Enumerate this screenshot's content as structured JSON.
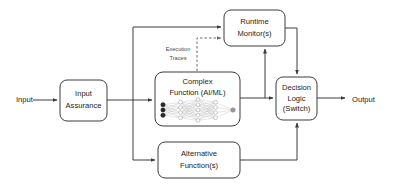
{
  "diagram": {
    "colors": {
      "stroke": "#3c3c3c",
      "dashed_stroke": "#6b6b6b",
      "text": "#1c1c1c",
      "trace_text": "#4a4a4a",
      "box_fill": "#ffffff",
      "background": "#ffffff",
      "nn_input_node": "#2a2a2a",
      "nn_hidden_node": "#ffffff",
      "nn_output_node": "#9a9a9a",
      "nn_edge": "#b8b8b8"
    },
    "io": {
      "input_label": "Input",
      "output_label": "Output"
    },
    "nodes": [
      {
        "id": "input-assurance",
        "lines": [
          "Input",
          "Assurance"
        ],
        "x": 60,
        "y": 80,
        "w": 47,
        "h": 41
      },
      {
        "id": "complex-function",
        "lines": [
          "Complex",
          "Function (AI/ML)"
        ],
        "x": 155,
        "y": 72,
        "w": 85,
        "h": 54
      },
      {
        "id": "runtime-monitor",
        "lines": [
          "Runtime",
          "Monitor(s)"
        ],
        "x": 224,
        "y": 10,
        "w": 61,
        "h": 36
      },
      {
        "id": "alternative-function",
        "lines": [
          "Alternative",
          "Function(s)"
        ],
        "x": 158,
        "y": 142,
        "w": 82,
        "h": 36
      },
      {
        "id": "decision-logic",
        "lines": [
          "Decision",
          "Logic",
          "(Switch)"
        ],
        "x": 276,
        "y": 77,
        "w": 41,
        "h": 43
      }
    ],
    "annotations": {
      "execution_traces": [
        "Execution",
        "Traces"
      ]
    },
    "neural_net": {
      "input_nodes": 3,
      "hidden_layers": [
        4,
        5,
        4
      ],
      "output_nodes": 1
    }
  }
}
